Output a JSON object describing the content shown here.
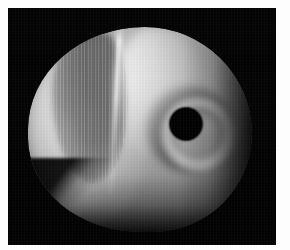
{
  "image": {
    "domain": "Natural-Image",
    "description": "Grayscale computer-rendered 3D shaded object on a black background",
    "width": 290,
    "height": 250,
    "frame_color": "#fdfdfd",
    "background_color": "#030303"
  },
  "plate": {
    "name": "render-viewport",
    "left": 8,
    "top": 8,
    "width": 268,
    "height": 237,
    "background_color": "#030303"
  },
  "object": {
    "name": "shaded-blob",
    "kind": "rounded-torus-like-solid",
    "silhouette": {
      "left": 20,
      "top": 19,
      "width": 224,
      "height": 205
    },
    "surface_tone_light": "#d9d9d9",
    "surface_tone_mid": "#8d8d8d",
    "surface_tone_dark": "#1e1e1e"
  },
  "features": {
    "hole": {
      "name": "circular-hole",
      "center_x": 178,
      "center_y": 116,
      "radius": 16,
      "fill_color": "#020202"
    },
    "highlight_ridge": {
      "name": "specular-crease",
      "x": 107,
      "top": 18,
      "height": 185,
      "color": "#ffffff"
    },
    "dark_band": {
      "name": "shadow-band",
      "left": 44,
      "top": 24,
      "width": 74,
      "height": 150
    },
    "bottom_facet": {
      "name": "bottom-left-chamfer"
    }
  }
}
